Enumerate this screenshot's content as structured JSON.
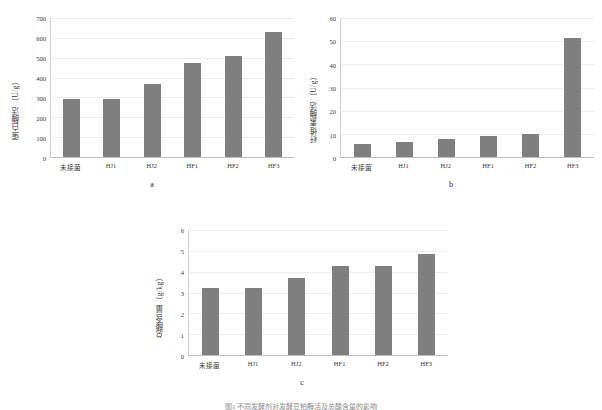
{
  "figure": {
    "caption": "图1  不同发酵剂对发酵豆粕酶活及总酸含量的影响",
    "bar_color": "#7f7f7f",
    "grid_color": "#ededed"
  },
  "chart_data": [
    {
      "id": "a",
      "type": "bar",
      "panel_letter": "a",
      "title": "",
      "xlabel": "",
      "ylabel": "蛋白酶活（U/g）",
      "categories": [
        "未接菌",
        "HJ1",
        "HJ2",
        "HF1",
        "HF2",
        "HF3"
      ],
      "values": [
        292,
        292,
        370,
        473,
        507,
        630
      ],
      "ylim": [
        0,
        700
      ],
      "yticks": [
        0,
        100,
        200,
        300,
        400,
        500,
        600,
        700
      ],
      "grid": true,
      "legend": "none"
    },
    {
      "id": "b",
      "type": "bar",
      "panel_letter": "b",
      "title": "",
      "xlabel": "",
      "ylabel": "纤维素酶活（U/g）",
      "categories": [
        "未接菌",
        "HJ1",
        "HJ2",
        "HF1",
        "HF2",
        "HF3"
      ],
      "values": [
        5.8,
        6.3,
        7.8,
        9.2,
        10.0,
        51.5
      ],
      "ylim": [
        0,
        60
      ],
      "yticks": [
        0,
        10,
        20,
        30,
        40,
        50,
        60
      ],
      "grid": true,
      "legend": "none"
    },
    {
      "id": "c",
      "type": "bar",
      "panel_letter": "c",
      "title": "",
      "xlabel": "",
      "ylabel": "总酸含量（g/kg）",
      "categories": [
        "未接菌",
        "HJ1",
        "HJ2",
        "HF1",
        "HF2",
        "HF3"
      ],
      "values": [
        3.2,
        3.2,
        3.72,
        4.25,
        4.25,
        4.85
      ],
      "ylim": [
        0,
        6
      ],
      "yticks": [
        0,
        1,
        2,
        3,
        4,
        5,
        6
      ],
      "grid": true,
      "legend": "none"
    }
  ]
}
